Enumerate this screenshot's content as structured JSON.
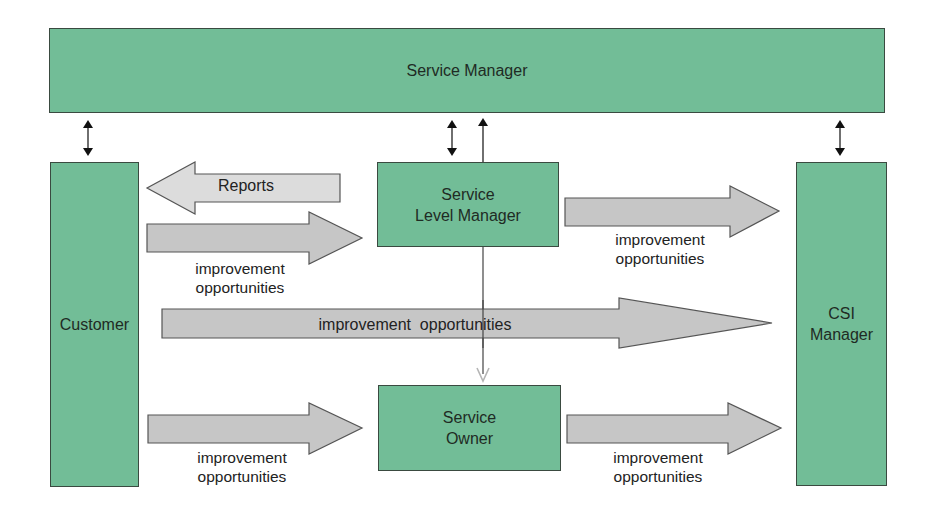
{
  "diagram": {
    "nodes": {
      "service_manager": "Service Manager",
      "customer": "Customer",
      "service_level_manager": "Service\nLevel Manager",
      "service_owner": "Service\nOwner",
      "csi_manager": "CSI\nManager"
    },
    "arrows": {
      "reports": "Reports",
      "customer_to_slm": "improvement\nopportunities",
      "slm_to_csi": "improvement\nopportunities",
      "customer_to_csi": "improvement  opportunities",
      "customer_to_owner": "improvement\nopportunities",
      "owner_to_csi": "improvement\nopportunities"
    },
    "colors": {
      "node_fill": "#72bd97",
      "node_border": "#3a4a40",
      "arrow_fill": "#c6c6c6",
      "reports_arrow_fill": "#dcdcdc",
      "arrow_border": "#555555",
      "connector": "#222222",
      "connector_light": "#b5b5b5"
    }
  }
}
